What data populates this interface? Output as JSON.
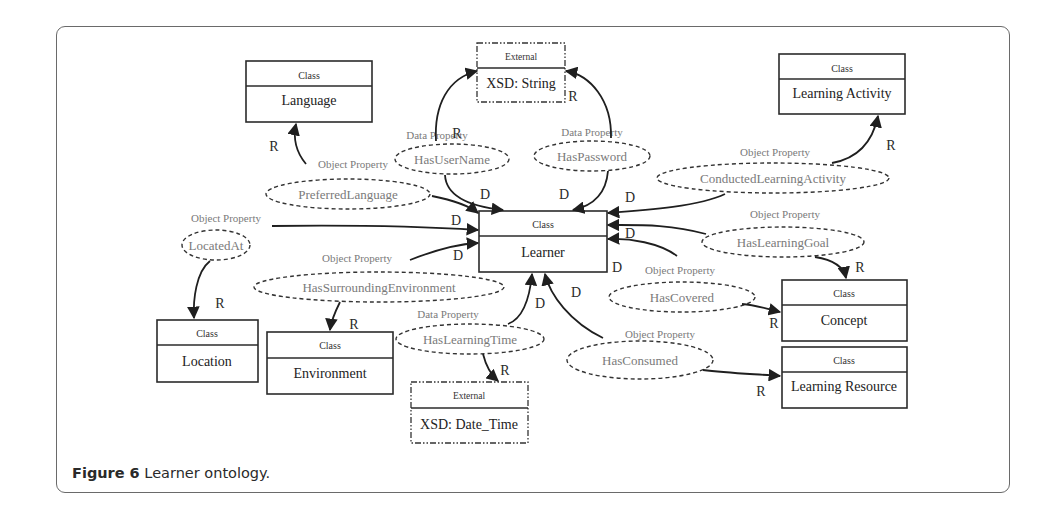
{
  "figure": {
    "caption_label": "Figure 6",
    "caption_text": " Learner ontology."
  },
  "classes": [
    {
      "id": "language",
      "header": "Class",
      "name": "Language"
    },
    {
      "id": "learning-activity",
      "header": "Class",
      "name": "Learning Activity"
    },
    {
      "id": "learner",
      "header": "Class",
      "name": "Learner"
    },
    {
      "id": "location",
      "header": "Class",
      "name": "Location"
    },
    {
      "id": "environment",
      "header": "Class",
      "name": "Environment"
    },
    {
      "id": "concept",
      "header": "Class",
      "name": "Concept"
    },
    {
      "id": "learning-resource",
      "header": "Class",
      "name": "Learning Resource"
    }
  ],
  "externals": [
    {
      "id": "xsd-string",
      "header": "External",
      "name": "XSD: String"
    },
    {
      "id": "xsd-date-time",
      "header": "External",
      "name": "XSD: Date_Time"
    }
  ],
  "properties": [
    {
      "id": "has-user-name",
      "type": "Data Property",
      "name": "HasUserName"
    },
    {
      "id": "has-password",
      "type": "Data Property",
      "name": "HasPassword"
    },
    {
      "id": "preferred-language",
      "type": "Object Property",
      "name": "PreferredLanguage"
    },
    {
      "id": "conducted-learning-activity",
      "type": "Object Property",
      "name": "ConductedLearningActivity"
    },
    {
      "id": "located-at",
      "type": "Object Property",
      "name": "LocatedAt"
    },
    {
      "id": "has-learning-goal",
      "type": "Object Property",
      "name": "HasLearningGoal"
    },
    {
      "id": "has-surrounding-environment",
      "type": "Object Property",
      "name": "HasSurroundingEnvironment"
    },
    {
      "id": "has-covered",
      "type": "Object Property",
      "name": "HasCovered"
    },
    {
      "id": "has-learning-time",
      "type": "Data Property",
      "name": "HasLearningTime"
    },
    {
      "id": "has-consumed",
      "type": "Object Property",
      "name": "HasConsumed"
    }
  ],
  "edge_labels": {
    "domain": "D",
    "range": "R"
  },
  "colors": {
    "box_stroke": "#2b2b2b",
    "property_text": "#7a7a7a",
    "class_text": "#222222",
    "arrow": "#1f1f1f"
  }
}
